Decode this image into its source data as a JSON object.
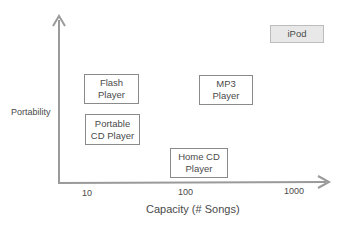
{
  "diagram": {
    "axes": {
      "y_label": "Portability",
      "x_label": "Capacity  (# Songs)",
      "x_ticks": [
        "10",
        "100",
        "1000"
      ]
    },
    "boxes": [
      {
        "id": "flash",
        "line1": "Flash",
        "line2": "Player"
      },
      {
        "id": "portable-cd",
        "line1": "Portable",
        "line2": "CD Player"
      },
      {
        "id": "mp3",
        "line1": "MP3",
        "line2": "Player"
      },
      {
        "id": "home-cd",
        "line1": "Home CD",
        "line2": "Player"
      },
      {
        "id": "ipod",
        "line1": "iPod",
        "line2": ""
      }
    ],
    "colors": {
      "axis": "#9a9a9a",
      "box_border": "#8a8a8a",
      "ipod_fill": "#e8e8e8"
    }
  }
}
